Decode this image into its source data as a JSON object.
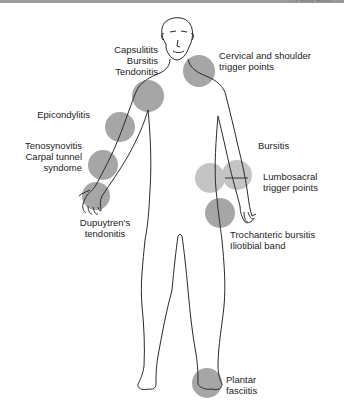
{
  "header": {
    "running_text": "...PAIN AND ..."
  },
  "figure": {
    "spot_colors": {
      "dark": "#a6a6a6",
      "light": "#c4c4c4"
    },
    "outline_color": "#2a2a2a"
  },
  "labels": {
    "capsulitis": "Capsulitits\nBursitis\nTendonitis",
    "cervical": "Cervical and shoulder\ntrigger points",
    "epicondylitis": "Epicondylitis",
    "tenosynovitis": "Tenosynovitis\nCarpal tunnel\nsyndome",
    "dupuytren": "Dupuytren's\ntendonitis",
    "bursitis": "Bursitis",
    "lumbosacral": "Lumbosacral\ntrigger points",
    "trochanteric": "Trochanteric bursitis\nIliotibial band",
    "plantar": "Plantar\nfasciitis"
  }
}
